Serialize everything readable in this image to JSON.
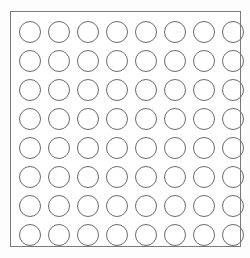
{
  "diagram": {
    "type": "grid-array-footprint",
    "background_color": "#fdfdfd",
    "canvas": {
      "width": 250,
      "height": 258
    },
    "outline": {
      "label": "package-outline",
      "shape": "rectangle",
      "x": 10,
      "y": 11,
      "width": 231,
      "height": 236,
      "border_color": "#7a7a7a",
      "border_width": 1,
      "fill_color": "#ffffff"
    },
    "grid": {
      "label": "pad-grid",
      "rows": 8,
      "columns": 8,
      "total_pads": 64,
      "pad_shape": "circle",
      "pad_diameter": 22,
      "pad_pitch_x": 29,
      "pad_pitch_y": 29,
      "stroke_color": "#6b6b6b",
      "stroke_width": 1,
      "fill_color": "transparent",
      "origin_x": 15,
      "origin_y": 17,
      "row_labels": [
        "1",
        "2",
        "3",
        "4",
        "5",
        "6",
        "7",
        "8"
      ],
      "column_labels": [
        "A",
        "B",
        "C",
        "D",
        "E",
        "F",
        "G",
        "H"
      ],
      "pads": [
        [
          "A1",
          "B1",
          "C1",
          "D1",
          "E1",
          "F1",
          "G1",
          "H1"
        ],
        [
          "A2",
          "B2",
          "C2",
          "D2",
          "E2",
          "F2",
          "G2",
          "H2"
        ],
        [
          "A3",
          "B3",
          "C3",
          "D3",
          "E3",
          "F3",
          "G3",
          "H3"
        ],
        [
          "A4",
          "B4",
          "C4",
          "D4",
          "E4",
          "F4",
          "G4",
          "H4"
        ],
        [
          "A5",
          "B5",
          "C5",
          "D5",
          "E5",
          "F5",
          "G5",
          "H5"
        ],
        [
          "A6",
          "B6",
          "C6",
          "D6",
          "E6",
          "F6",
          "G6",
          "H6"
        ],
        [
          "A7",
          "B7",
          "C7",
          "D7",
          "E7",
          "F7",
          "G7",
          "H7"
        ],
        [
          "A8",
          "B8",
          "C8",
          "D8",
          "E8",
          "F8",
          "G8",
          "H8"
        ]
      ]
    }
  }
}
